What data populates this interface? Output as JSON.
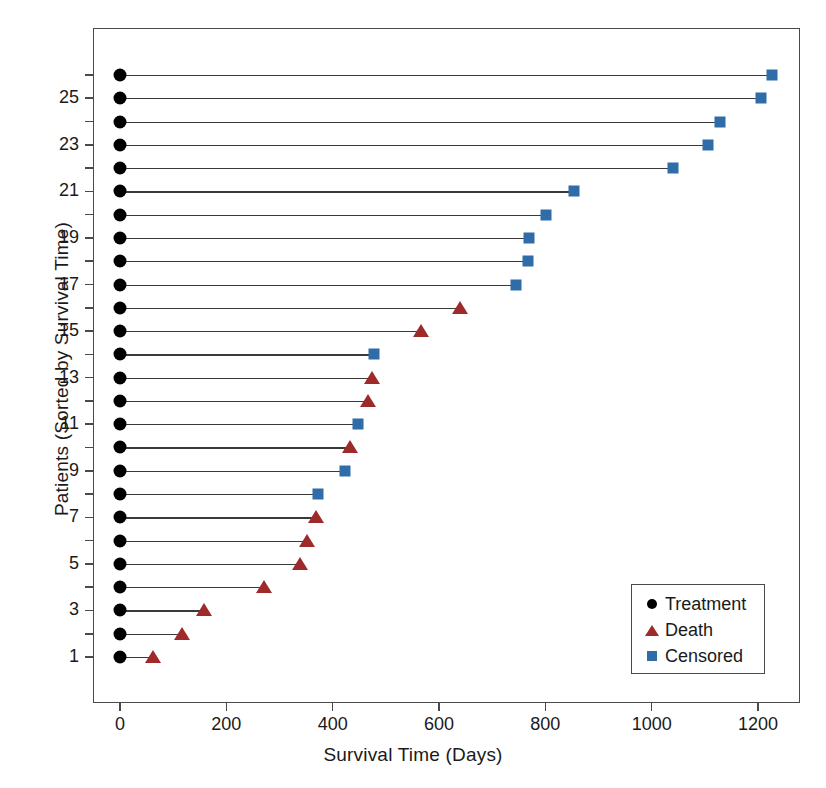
{
  "chart_data": {
    "type": "scatter",
    "title": "",
    "xlabel": "Survival Time (Days)",
    "ylabel": "Patients (Sorted by Survival Time)",
    "xlim": [
      -40,
      1290
    ],
    "ylim": [
      0,
      27
    ],
    "grid": false,
    "xticks": [
      0,
      200,
      400,
      600,
      800,
      1000,
      1200
    ],
    "xticklabels": [
      "0",
      "200",
      "400",
      "600",
      "800",
      "1000",
      "1200"
    ],
    "yticks": [
      1,
      3,
      5,
      7,
      9,
      11,
      13,
      15,
      17,
      19,
      21,
      23,
      25
    ],
    "yticklabels": [
      "1",
      "3",
      "5",
      "7",
      "9",
      "11",
      "13",
      "15",
      "17",
      "19",
      "21",
      "23",
      "25"
    ],
    "legend": {
      "position": "bottom-right",
      "entries": [
        {
          "label": "Treatment",
          "marker": "circle",
          "color": "#000000"
        },
        {
          "label": "Death",
          "marker": "triangle",
          "color": "#9E2A2A"
        },
        {
          "label": "Censored",
          "marker": "square",
          "color": "#2E6DA8"
        }
      ]
    },
    "series": [
      {
        "name": "Treatment start",
        "marker": "circle",
        "color": "#000000"
      },
      {
        "name": "Death",
        "marker": "triangle",
        "color": "#9E2A2A"
      },
      {
        "name": "Censored",
        "marker": "square",
        "color": "#2E6DA8"
      }
    ],
    "rows": [
      {
        "patient": 1,
        "start": 0,
        "time": 62,
        "status": "Death"
      },
      {
        "patient": 2,
        "start": 0,
        "time": 117,
        "status": "Death"
      },
      {
        "patient": 3,
        "start": 0,
        "time": 158,
        "status": "Death"
      },
      {
        "patient": 4,
        "start": 0,
        "time": 271,
        "status": "Death"
      },
      {
        "patient": 5,
        "start": 0,
        "time": 339,
        "status": "Death"
      },
      {
        "patient": 6,
        "start": 0,
        "time": 352,
        "status": "Death"
      },
      {
        "patient": 7,
        "start": 0,
        "time": 369,
        "status": "Death"
      },
      {
        "patient": 8,
        "start": 0,
        "time": 372,
        "status": "Censored"
      },
      {
        "patient": 9,
        "start": 0,
        "time": 423,
        "status": "Censored"
      },
      {
        "patient": 10,
        "start": 0,
        "time": 433,
        "status": "Death"
      },
      {
        "patient": 11,
        "start": 0,
        "time": 448,
        "status": "Censored"
      },
      {
        "patient": 12,
        "start": 0,
        "time": 466,
        "status": "Death"
      },
      {
        "patient": 13,
        "start": 0,
        "time": 474,
        "status": "Death"
      },
      {
        "patient": 14,
        "start": 0,
        "time": 478,
        "status": "Censored"
      },
      {
        "patient": 15,
        "start": 0,
        "time": 566,
        "status": "Death"
      },
      {
        "patient": 16,
        "start": 0,
        "time": 640,
        "status": "Death"
      },
      {
        "patient": 17,
        "start": 0,
        "time": 745,
        "status": "Censored"
      },
      {
        "patient": 18,
        "start": 0,
        "time": 767,
        "status": "Censored"
      },
      {
        "patient": 19,
        "start": 0,
        "time": 770,
        "status": "Censored"
      },
      {
        "patient": 20,
        "start": 0,
        "time": 801,
        "status": "Censored"
      },
      {
        "patient": 21,
        "start": 0,
        "time": 854,
        "status": "Censored"
      },
      {
        "patient": 22,
        "start": 0,
        "time": 1040,
        "status": "Censored"
      },
      {
        "patient": 23,
        "start": 0,
        "time": 1106,
        "status": "Censored"
      },
      {
        "patient": 24,
        "start": 0,
        "time": 1128,
        "status": "Censored"
      },
      {
        "patient": 25,
        "start": 0,
        "time": 1206,
        "status": "Censored"
      },
      {
        "patient": 26,
        "start": 0,
        "time": 1226,
        "status": "Censored"
      }
    ]
  },
  "colors": {
    "treatment": "#000000",
    "death": "#9E2A2A",
    "censored": "#2E6DA8",
    "axis": "#4a4a4a",
    "line": "#3a3a3a",
    "background": "#ffffff"
  }
}
